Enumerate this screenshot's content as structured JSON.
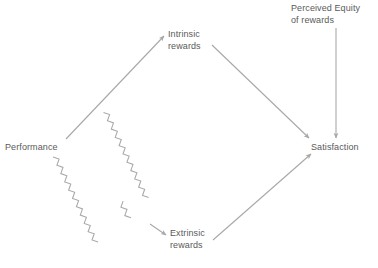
{
  "diagram": {
    "background_color": "#ffffff",
    "line_color": "#a8a8a8",
    "text_color": "#5a5a5a",
    "nodes": [
      {
        "id": "performance",
        "label": "Performance",
        "lines": [
          "Performance"
        ]
      },
      {
        "id": "intrinsic",
        "label": "Intrinsic rewards",
        "lines": [
          "Intrinsic",
          "rewards"
        ]
      },
      {
        "id": "extrinsic",
        "label": "Extrinsic rewards",
        "lines": [
          "Extrinsic",
          "rewards"
        ]
      },
      {
        "id": "satisfaction",
        "label": "Satisfaction",
        "lines": [
          "Satisfaction"
        ]
      },
      {
        "id": "equity",
        "label": "Perceived Equity of rewards",
        "lines": [
          "Perceived Equity",
          "of rewards"
        ]
      }
    ],
    "edges": [
      {
        "id": "performance-to-intrinsic",
        "from": "Performance",
        "to": "Intrinsic rewards",
        "style": "straight",
        "direction": "up-right"
      },
      {
        "id": "performance-to-extrinsic",
        "from": "Performance",
        "to": "Extrinsic rewards",
        "style": "wavy",
        "direction": "down-right"
      },
      {
        "id": "intrinsic-to-satisfaction",
        "from": "Intrinsic rewards",
        "to": "Satisfaction",
        "style": "straight",
        "direction": "down-right"
      },
      {
        "id": "extrinsic-to-satisfaction",
        "from": "Extrinsic rewards",
        "to": "Satisfaction",
        "style": "straight",
        "direction": "up-right"
      },
      {
        "id": "equity-to-satisfaction",
        "from": "Perceived Equity of rewards",
        "to": "Satisfaction",
        "style": "straight",
        "direction": "down"
      }
    ]
  }
}
